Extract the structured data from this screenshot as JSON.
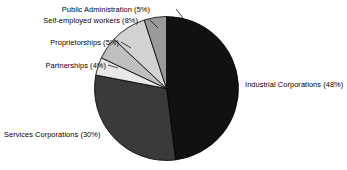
{
  "chart_data": {
    "type": "pie",
    "title": "",
    "subtitle": "",
    "xlabel": "",
    "ylabel": "",
    "legend_position": "none",
    "grid": false,
    "units": "percent",
    "total": 100,
    "start_angle_deg": 0,
    "direction": "clockwise",
    "categories": [
      "Industrial Corporations",
      "Services Corporations",
      "Partnerships",
      "Proprietorships",
      "Self-employed workers",
      "Public Administration"
    ],
    "values": [
      48,
      30,
      4,
      5,
      8,
      5
    ],
    "slices": [
      {
        "name": "Industrial Corporations",
        "value": 48,
        "label": "Industrial Corporations (48%)",
        "percent_text": "(48%)",
        "color": "#111111",
        "start_deg": 0,
        "end_deg": 172.8,
        "label_side": "right"
      },
      {
        "name": "Services Corporations",
        "value": 30,
        "label": "Services Corporations (30%)",
        "percent_text": "(30%)",
        "color": "#3a3a3a",
        "start_deg": 172.8,
        "end_deg": 280.8,
        "label_side": "bottom-left"
      },
      {
        "name": "Partnerships",
        "value": 4,
        "label": "Partnerships (4%)",
        "percent_text": "(4%)",
        "color": "#e8e8e8",
        "start_deg": 280.8,
        "end_deg": 295.2,
        "label_side": "left"
      },
      {
        "name": "Proprietorships",
        "value": 5,
        "label": "Proprietorships (5%)",
        "percent_text": "(5%)",
        "color": "#bfbfbf",
        "start_deg": 295.2,
        "end_deg": 313.2,
        "label_side": "left"
      },
      {
        "name": "Self-employed workers",
        "value": 8,
        "label": "Self-employed workers (8%)",
        "percent_text": "(8%)",
        "color": "#d2d2d2",
        "start_deg": 313.2,
        "end_deg": 342.0,
        "label_side": "left"
      },
      {
        "name": "Public Administration",
        "value": 5,
        "label": "Public Administration (5%)",
        "percent_text": "(5%)",
        "color": "#9a9a9a",
        "start_deg": 342.0,
        "end_deg": 360.0,
        "label_side": "left"
      }
    ]
  },
  "colors": {
    "background": "#ffffff",
    "text": "#000000",
    "outline": "#000000",
    "leader_line": "#000000"
  }
}
